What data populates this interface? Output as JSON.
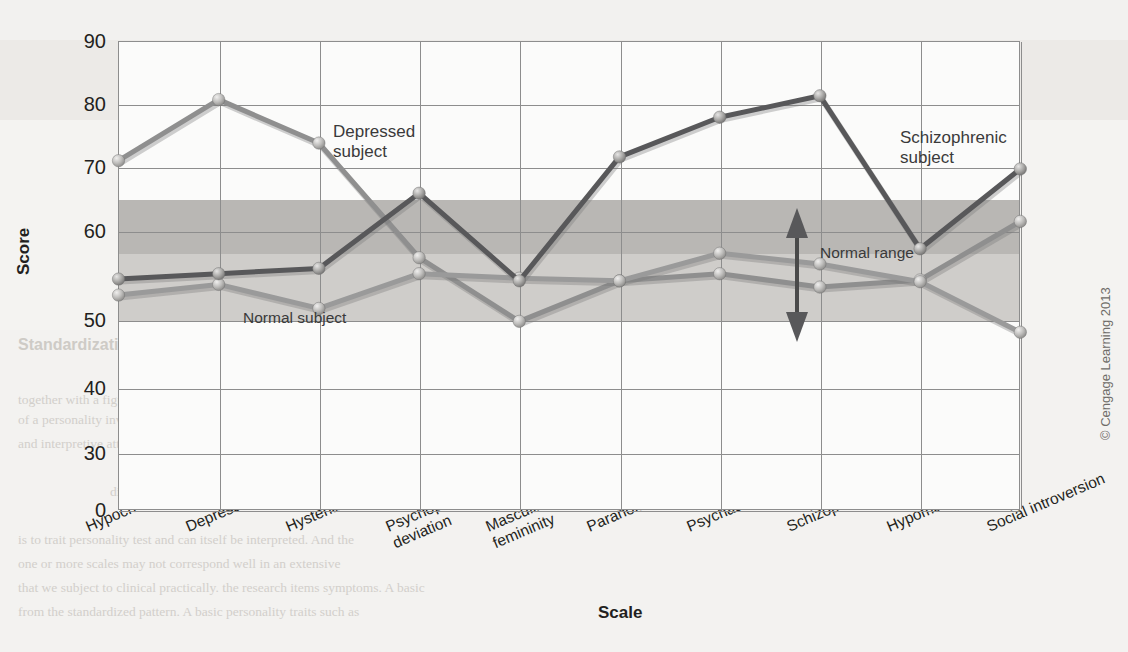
{
  "figure": {
    "y_axis_title": "Score",
    "x_axis_title": "Scale",
    "copyright": "© Cengage Learning 2013"
  },
  "annotations": {
    "depressed_line1": "Depressed",
    "depressed_line2": "subject",
    "schizophrenic_line1": "Schizophrenic",
    "schizophrenic_line2": "subject",
    "normal_subject": "Normal subject",
    "normal_range": "Normal range"
  },
  "ghost_page": {
    "head": "MMPI–Personality Assessment",
    "sub_left": "Standardization",
    "sub_right": "The Inkblot",
    "colors": {
      "paper": "#f4f3f1",
      "ink": "#231f20"
    },
    "body_lines": [
      "together with a figure",
      "of a personality inventory measuring several",
      "The Minnesota Multiphasic Personality Inventory",
      "and interpretive attributes  (known as MMPI) that was widely used. Each scale",
      "The MMPI was originally developed and the scale that",
      "differs in its profile of traits depicted.",
      "is to trait personality test and can itself be interpreted. And the",
      "one or more scales may not correspond well in an extensive",
      "that we subject to clinical practically.  the research items symptoms. A basic",
      "from the standardized pattern. A basic personality traits such as"
    ]
  },
  "chart_data": {
    "type": "line",
    "title": "",
    "xlabel": "Scale",
    "ylabel": "Score",
    "ylim": [
      0,
      90
    ],
    "y_ticks": [
      90,
      80,
      70,
      60,
      50,
      40,
      30,
      0
    ],
    "grid": true,
    "legend": "inline-annotations",
    "normal_range_band": {
      "low": 57.5,
      "high": 65,
      "label": "Normal range"
    },
    "shaded_lower_band": {
      "low": 50,
      "high": 57.5
    },
    "categories": [
      "Hypochondriasis",
      "Depression",
      "Hysteria",
      "Psychopathic deviation",
      "Masculinity/femininity",
      "Paranoia",
      "Psychasthenia",
      "Schizophrenia",
      "Hypomania",
      "Social introversion"
    ],
    "category_lines": [
      [
        "Hypochondriasis"
      ],
      [
        "Depression"
      ],
      [
        "Hysteria"
      ],
      [
        "Psychopathic",
        "deviation"
      ],
      [
        "Masculinity/",
        "femininity"
      ],
      [
        "Paranoia"
      ],
      [
        "Psychasthenia"
      ],
      [
        "Schizophrenia"
      ],
      [
        "Hypomania"
      ],
      [
        "Social introversion"
      ]
    ],
    "series": [
      {
        "name": "Depressed subject",
        "color": "#8f8f8f",
        "values": [
          71.0,
          80.7,
          73.8,
          57.0,
          49.8,
          54.4,
          55.2,
          53.7,
          54.5,
          61.5
        ]
      },
      {
        "name": "Normal subject",
        "color": "#9a9a9a",
        "values": [
          52.8,
          54.0,
          51.3,
          55.2,
          54.7,
          54.4,
          57.5,
          56.3,
          54.3,
          48.2
        ]
      },
      {
        "name": "Schizophrenic subject",
        "color": "#58585a",
        "values": [
          54.6,
          55.2,
          55.8,
          65.9,
          54.4,
          71.6,
          77.9,
          81.3,
          58.0,
          69.7
        ]
      }
    ]
  }
}
